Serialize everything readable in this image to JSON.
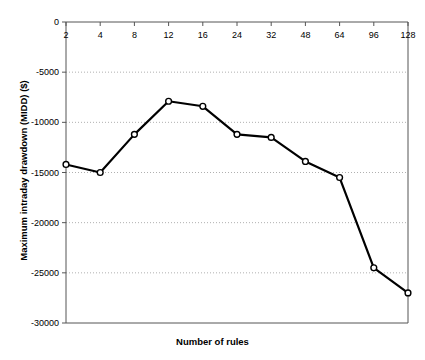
{
  "chart_data": {
    "type": "line",
    "title": "",
    "xlabel": "Number of rules",
    "ylabel": "Maximum intraday drawdown (MIDD) ($)",
    "categories": [
      "2",
      "4",
      "8",
      "12",
      "16",
      "24",
      "32",
      "48",
      "64",
      "96",
      "128"
    ],
    "values": [
      -14200,
      -15000,
      -11200,
      -7900,
      -8400,
      -11200,
      -11500,
      -13900,
      -15500,
      -24500,
      -27000
    ],
    "series": [
      {
        "name": "MIDD",
        "values": [
          -14200,
          -15000,
          -11200,
          -7900,
          -8400,
          -11200,
          -11500,
          -13900,
          -15500,
          -24500,
          -27000
        ]
      }
    ],
    "ylim": [
      -30000,
      0
    ],
    "yticks": [
      "0",
      "-5000",
      "-10000",
      "-15000",
      "-20000",
      "-25000",
      "-30000"
    ],
    "ytick_values": [
      0,
      -5000,
      -10000,
      -15000,
      -20000,
      -25000,
      -30000
    ],
    "xticks": [
      "2",
      "4",
      "8",
      "12",
      "16",
      "24",
      "32",
      "48",
      "64",
      "96",
      "128"
    ],
    "grid": true,
    "grid_style": "dotted-horizontal",
    "legend": "none",
    "xaxis_position": "top",
    "xtick_label_position": "inside-below-top-axis",
    "marker": "open-circle",
    "line_color": "#000000",
    "marker_fill": "#ffffff",
    "grid_color": "#b0b0b0",
    "axis_color": "#555555",
    "background": "#ffffff"
  }
}
